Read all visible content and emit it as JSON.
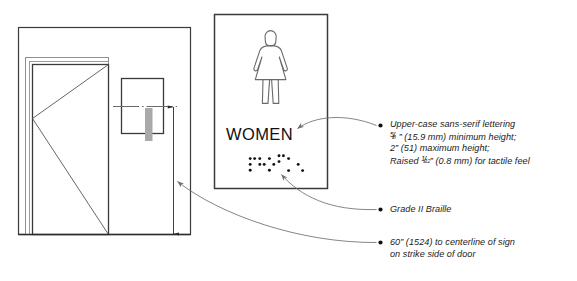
{
  "diagram": {
    "colors": {
      "line": "#3a3a3a",
      "heavy_line": "#2b2b2b",
      "thin_line": "#8a8a8a",
      "leader": "#6f6f6f",
      "braille_dot": "#111111",
      "gray_fill": "#a9a9a9",
      "text": "#1a1a1a",
      "background": "#ffffff"
    }
  },
  "door_elevation": {
    "name": "door-elevation-panel",
    "parts": [
      {
        "name": "wall-outline",
        "label": "wall"
      },
      {
        "name": "door-frame",
        "label": "door frame"
      },
      {
        "name": "door-leaf",
        "label": "door leaf"
      },
      {
        "name": "door-swing-indicator",
        "label": "swing direction"
      },
      {
        "name": "wall-mounted-sign",
        "label": "sign on wall"
      },
      {
        "name": "braille-strip",
        "label": "braille strip"
      },
      {
        "name": "sign-centerline",
        "label": "centerline of sign"
      },
      {
        "name": "height-dimension-line",
        "label": "60 in mounting height"
      }
    ]
  },
  "sign": {
    "name": "restroom-sign",
    "pictogram": "women-figure-icon",
    "word": "WOMEN",
    "braille": {
      "label": "Grade II Braille",
      "cells": [
        {
          "dots": [
            1,
            2,
            3,
            4
          ]
        },
        {
          "dots": [
            1,
            2,
            5
          ]
        },
        {
          "dots": [
            1,
            3,
            6
          ]
        },
        {
          "dots": [
            1,
            4,
            5
          ]
        },
        {
          "dots": [
            2,
            4
          ]
        },
        {
          "dots": [
            3,
            6
          ]
        }
      ]
    }
  },
  "annotations": [
    {
      "name": "annotation-lettering",
      "lines": [
        {
          "type": "plain",
          "text": "Upper-case sans-serif lettering"
        },
        {
          "type": "frac",
          "num": "5",
          "den": "8",
          "text": "” (15.9 mm) minimum height;"
        },
        {
          "type": "plain",
          "text": "2” (51) maximum height;"
        },
        {
          "type": "frac_mid",
          "pre": "Raised ",
          "num": "1",
          "den": "32",
          "text": "” (0.8 mm) for tactile feel"
        }
      ],
      "target": "sign-word"
    },
    {
      "name": "annotation-braille",
      "lines": [
        {
          "type": "plain",
          "text": "Grade II Braille"
        }
      ],
      "target": "braille-dots"
    },
    {
      "name": "annotation-mounting-height",
      "lines": [
        {
          "type": "plain",
          "text": "60” (1524) to centerline of sign"
        },
        {
          "type": "plain",
          "text": "on strike side of door"
        }
      ],
      "target": "height-dimension-line"
    }
  ]
}
